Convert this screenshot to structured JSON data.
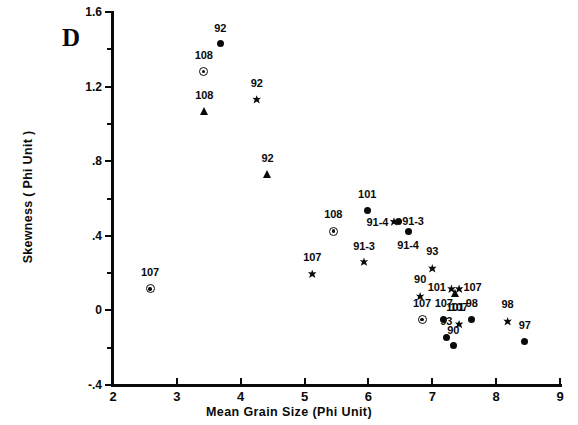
{
  "panel": {
    "label": "D"
  },
  "axes": {
    "xlabel": "Mean Grain Size (Phi Unit)",
    "ylabel": "Skewness ( Phi Unit )",
    "xticks": [
      "2",
      "3",
      "4",
      "5",
      "6",
      "7",
      "8",
      "9"
    ],
    "yticks": [
      "1.6",
      "1.2",
      ".8",
      ".4",
      "0",
      "-.4"
    ]
  },
  "chart_data": {
    "type": "scatter",
    "title": "D",
    "xlabel": "Mean Grain Size (Phi Unit)",
    "ylabel": "Skewness ( Phi Unit )",
    "xlim": [
      2,
      9
    ],
    "ylim": [
      -0.4,
      1.6
    ],
    "xtick_values": [
      2,
      3,
      4,
      5,
      6,
      7,
      8,
      9
    ],
    "ytick_values": [
      1.6,
      1.2,
      0.8,
      0.4,
      0.0,
      -0.4
    ],
    "yminor_tick_values": [
      1.4,
      1.0,
      0.6,
      0.2,
      -0.2
    ],
    "grid": false,
    "legend": "none",
    "marker_types": [
      "circle",
      "star",
      "triangle",
      "ringdot"
    ],
    "points": [
      {
        "label": "92",
        "marker": "circle",
        "x": 3.68,
        "y": 1.43,
        "lx": 3.68,
        "ly": 1.48,
        "pos": "above"
      },
      {
        "label": "108",
        "marker": "ringdot",
        "x": 3.42,
        "y": 1.28,
        "lx": 3.42,
        "ly": 1.335,
        "pos": "above"
      },
      {
        "label": "108",
        "marker": "triangle",
        "x": 3.43,
        "y": 1.07,
        "lx": 3.43,
        "ly": 1.125,
        "pos": "above"
      },
      {
        "label": "92",
        "marker": "star",
        "x": 4.25,
        "y": 1.13,
        "lx": 4.25,
        "ly": 1.185,
        "pos": "above"
      },
      {
        "label": "92",
        "marker": "triangle",
        "x": 4.42,
        "y": 0.73,
        "lx": 4.42,
        "ly": 0.785,
        "pos": "above"
      },
      {
        "label": "101",
        "marker": "circle",
        "x": 5.98,
        "y": 0.535,
        "lx": 5.98,
        "ly": 0.59,
        "pos": "above"
      },
      {
        "label": "108",
        "marker": "ringdot",
        "x": 5.45,
        "y": 0.425,
        "lx": 5.45,
        "ly": 0.485,
        "pos": "above"
      },
      {
        "label": "91-4",
        "marker": "star",
        "x": 6.4,
        "y": 0.475,
        "lx": 6.31,
        "ly": 0.475,
        "pos": "left"
      },
      {
        "label": "91-3",
        "marker": "circle",
        "x": 6.47,
        "y": 0.475,
        "lx": 6.53,
        "ly": 0.478,
        "pos": "right"
      },
      {
        "label": "91-4",
        "marker": "circle",
        "x": 6.62,
        "y": 0.425,
        "lx": 6.62,
        "ly": 0.375,
        "pos": "below"
      },
      {
        "label": "91-3",
        "marker": "star",
        "x": 5.93,
        "y": 0.26,
        "lx": 5.93,
        "ly": 0.315,
        "pos": "above"
      },
      {
        "label": "107",
        "marker": "star",
        "x": 5.12,
        "y": 0.195,
        "lx": 5.12,
        "ly": 0.255,
        "pos": "above"
      },
      {
        "label": "107",
        "marker": "ringdot",
        "x": 2.58,
        "y": 0.115,
        "lx": 2.58,
        "ly": 0.175,
        "pos": "above"
      },
      {
        "label": "93",
        "marker": "star",
        "x": 7.0,
        "y": 0.225,
        "lx": 7.0,
        "ly": 0.285,
        "pos": "above"
      },
      {
        "label": "101",
        "marker": "star",
        "x": 7.3,
        "y": 0.115,
        "lx": 7.21,
        "ly": 0.125,
        "pos": "left"
      },
      {
        "label": "107",
        "marker": "star",
        "x": 7.42,
        "y": 0.115,
        "lx": 7.49,
        "ly": 0.125,
        "pos": "right"
      },
      {
        "label": "101",
        "marker": "triangle",
        "x": 7.36,
        "y": 0.095,
        "lx": 7.36,
        "ly": 0.045,
        "pos": "below"
      },
      {
        "label": "90",
        "marker": "star",
        "x": 6.81,
        "y": 0.075,
        "lx": 6.81,
        "ly": 0.135,
        "pos": "above"
      },
      {
        "label": "107",
        "marker": "ringdot",
        "x": 6.84,
        "y": -0.05,
        "lx": 6.84,
        "ly": 0.01,
        "pos": "above"
      },
      {
        "label": "107",
        "marker": "circle",
        "x": 7.18,
        "y": -0.05,
        "lx": 7.18,
        "ly": 0.01,
        "pos": "above"
      },
      {
        "label": "98",
        "marker": "circle",
        "x": 7.62,
        "y": -0.05,
        "lx": 7.62,
        "ly": 0.01,
        "pos": "above"
      },
      {
        "label": "107",
        "marker": "star",
        "x": 7.42,
        "y": -0.075,
        "lx": 7.42,
        "ly": -0.015,
        "pos": "above"
      },
      {
        "label": "98",
        "marker": "star",
        "x": 8.18,
        "y": -0.06,
        "lx": 8.18,
        "ly": 0.0,
        "pos": "above"
      },
      {
        "label": "93",
        "marker": "circle",
        "x": 7.22,
        "y": -0.145,
        "lx": 7.22,
        "ly": -0.09,
        "pos": "above"
      },
      {
        "label": "90",
        "marker": "circle",
        "x": 7.33,
        "y": -0.19,
        "lx": 7.33,
        "ly": -0.135,
        "pos": "above"
      },
      {
        "label": "97",
        "marker": "circle",
        "x": 8.45,
        "y": -0.165,
        "lx": 8.45,
        "ly": -0.11,
        "pos": "above"
      }
    ]
  },
  "edge_artifact": {
    "text": ""
  }
}
